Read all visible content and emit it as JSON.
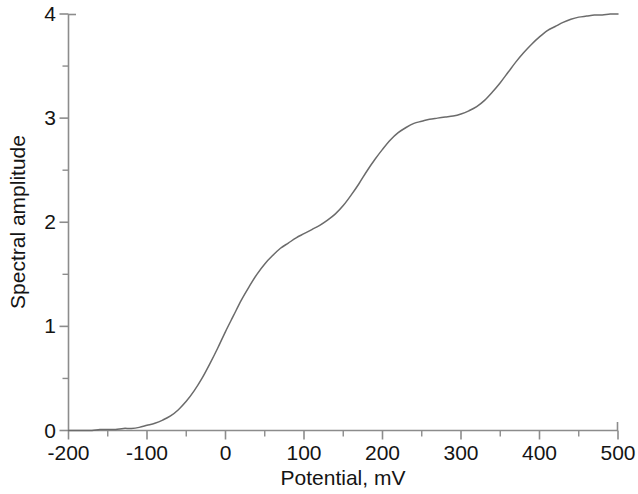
{
  "chart_data": {
    "type": "line",
    "title": "",
    "xlabel": "Potential, mV",
    "ylabel": "Spectral amplitude",
    "xlim": [
      -200,
      500
    ],
    "ylim": [
      0,
      4
    ],
    "grid": false,
    "legend": null,
    "line_color": "#6b6b6b",
    "axis_color": "#8c8c8c",
    "background": "#ffffff",
    "xticks": [
      -200,
      -100,
      0,
      100,
      200,
      300,
      400,
      500
    ],
    "xtick_labels": [
      "-200",
      "-100",
      "0",
      "100",
      "200",
      "300",
      "400",
      "500"
    ],
    "xminor_ticks": [
      -150,
      -50,
      50,
      150,
      250,
      350,
      450
    ],
    "yticks": [
      0,
      1,
      2,
      3,
      4
    ],
    "ytick_labels": [
      "0",
      "1",
      "2",
      "3",
      "4"
    ],
    "yminor_ticks": [
      0.5,
      1.5,
      2.5,
      3.5
    ],
    "series": [
      {
        "name": "Spectral amplitude",
        "x": [
          -200,
          -190,
          -180,
          -170,
          -160,
          -150,
          -140,
          -130,
          -120,
          -110,
          -100,
          -90,
          -80,
          -70,
          -60,
          -50,
          -40,
          -30,
          -20,
          -10,
          0,
          10,
          20,
          30,
          40,
          50,
          60,
          70,
          80,
          90,
          100,
          110,
          120,
          130,
          140,
          150,
          160,
          170,
          180,
          190,
          200,
          210,
          220,
          230,
          240,
          250,
          260,
          270,
          280,
          290,
          300,
          310,
          320,
          330,
          340,
          350,
          360,
          370,
          380,
          390,
          400,
          410,
          420,
          430,
          440,
          450,
          460,
          470,
          480,
          490,
          500
        ],
        "y": [
          0.0,
          0.0,
          0.0,
          0.0,
          0.01,
          0.01,
          0.01,
          0.02,
          0.02,
          0.03,
          0.05,
          0.07,
          0.1,
          0.14,
          0.2,
          0.28,
          0.38,
          0.5,
          0.64,
          0.79,
          0.95,
          1.1,
          1.25,
          1.38,
          1.5,
          1.6,
          1.68,
          1.75,
          1.8,
          1.85,
          1.89,
          1.93,
          1.97,
          2.02,
          2.08,
          2.16,
          2.26,
          2.37,
          2.49,
          2.6,
          2.7,
          2.79,
          2.86,
          2.91,
          2.95,
          2.97,
          2.99,
          3.0,
          3.01,
          3.02,
          3.04,
          3.07,
          3.11,
          3.17,
          3.25,
          3.34,
          3.44,
          3.54,
          3.63,
          3.71,
          3.78,
          3.84,
          3.88,
          3.92,
          3.95,
          3.97,
          3.98,
          3.99,
          3.99,
          4.0,
          4.0
        ]
      }
    ]
  },
  "axes": {
    "x_title": "Potential, mV",
    "y_title": "Spectral amplitude"
  }
}
